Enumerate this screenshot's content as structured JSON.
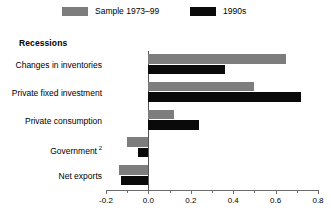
{
  "legend": {
    "items": [
      {
        "label": "Sample 1973–99",
        "color": "#7d7d7d",
        "key": "sample"
      },
      {
        "label": "1990s",
        "color": "#0a0a0a",
        "key": "nineties"
      }
    ]
  },
  "panel": {
    "title": "Recessions"
  },
  "chart_data": {
    "type": "bar",
    "orientation": "horizontal",
    "title": "Recessions",
    "xlabel": "",
    "ylabel": "",
    "xlim": [
      -0.2,
      0.8
    ],
    "grid": false,
    "legend_position": "top",
    "categories": [
      "Changes in inventories",
      "Private fixed investment",
      "Private consumption",
      "Government",
      "Net exports"
    ],
    "category_footnotes": [
      "",
      "",
      "",
      "2",
      ""
    ],
    "xticks": [
      -0.2,
      0.0,
      0.2,
      0.4,
      0.6,
      0.8
    ],
    "xtick_labels": [
      "-0.2",
      "0.0",
      "0.2",
      "0.4",
      "0.6",
      "0.8"
    ],
    "minor_xticks": [
      -0.1,
      0.1,
      0.3,
      0.5,
      0.7
    ],
    "series": [
      {
        "name": "Sample 1973–99",
        "color": "#7d7d7d",
        "values": [
          0.65,
          0.5,
          0.12,
          -0.1,
          -0.14
        ]
      },
      {
        "name": "1990s",
        "color": "#0a0a0a",
        "values": [
          0.36,
          0.72,
          0.24,
          -0.05,
          -0.13
        ]
      }
    ]
  }
}
